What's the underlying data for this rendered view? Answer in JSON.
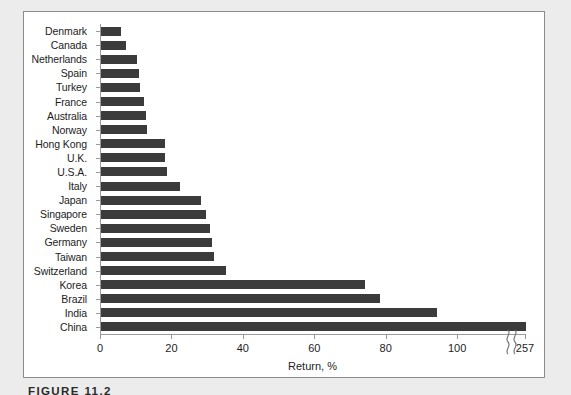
{
  "figure": {
    "caption": "FIGURE 11.2"
  },
  "chart_data": {
    "type": "bar",
    "orientation": "horizontal",
    "title": "",
    "xlabel": "Return, %",
    "ylabel": "",
    "xlim": [
      0,
      100
    ],
    "xticks": [
      0,
      20,
      40,
      60,
      80,
      100
    ],
    "xticklabels": [
      "0",
      "20",
      "40",
      "60",
      "80",
      "100"
    ],
    "axis_break": {
      "present": true,
      "symbol": "wavy-break",
      "final_tick_label": "257"
    },
    "grid": false,
    "legend": false,
    "bar_color": "#3b3b3b",
    "categories": [
      "Denmark",
      "Canada",
      "Netherlands",
      "Spain",
      "Turkey",
      "France",
      "Australia",
      "Norway",
      "Hong Kong",
      "U.K.",
      "U.S.A.",
      "Italy",
      "Japan",
      "Singapore",
      "Sweden",
      "Germany",
      "Taiwan",
      "Switzerland",
      "Korea",
      "Brazil",
      "India",
      "China"
    ],
    "values": [
      5.5,
      7,
      10,
      10.5,
      11,
      12,
      12.5,
      13,
      18,
      18,
      18.5,
      22,
      28,
      29.5,
      30.5,
      31,
      31.5,
      35,
      74,
      78,
      94,
      257
    ]
  }
}
